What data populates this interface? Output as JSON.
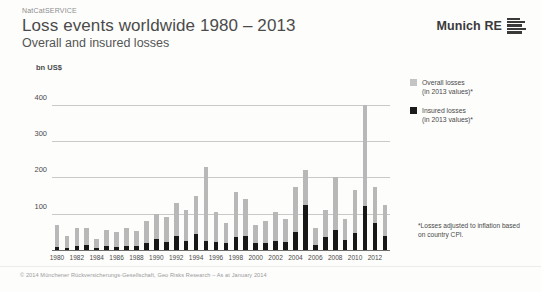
{
  "header": {
    "eyebrow": "NatCatSERVICE",
    "title": "Loss events worldwide 1980 – 2013",
    "subtitle": "Overall and insured losses",
    "brand": "Munich RE",
    "brand_mark": "munich-re-logo-bars"
  },
  "legend": {
    "overall_line1": "Overall losses",
    "overall_line2": "(in 2013 values)*",
    "insured_line1": "Insured losses",
    "insured_line2": "(in 2013 values)*"
  },
  "footnote": "*Losses adjusted to inflation based on country CPI.",
  "copyright": "© 2014 Münchener Rückversicherungs-Gesellschaft, Geo Risks Research – As at January 2014",
  "colors": {
    "overall": "#b8b8b8",
    "insured": "#171717",
    "grid": "#c9c9c9",
    "axis": "#6d6d6d",
    "text": "#4a4a4a"
  },
  "chart_data": {
    "type": "bar",
    "title": "Loss events worldwide 1980 – 2013",
    "subtitle": "Overall and insured losses",
    "xlabel": "",
    "ylabel": "bn US$",
    "ylim": [
      0,
      430
    ],
    "yticks": [
      100,
      200,
      300,
      400
    ],
    "ytick_labels": [
      "100",
      "200",
      "300",
      "400"
    ],
    "grid": true,
    "stacked": false,
    "legend_position": "right",
    "categories": [
      "1980",
      "1981",
      "1982",
      "1983",
      "1984",
      "1985",
      "1986",
      "1987",
      "1988",
      "1989",
      "1990",
      "1991",
      "1992",
      "1993",
      "1994",
      "1995",
      "1996",
      "1997",
      "1998",
      "1999",
      "2000",
      "2001",
      "2002",
      "2003",
      "2004",
      "2005",
      "2006",
      "2007",
      "2008",
      "2009",
      "2010",
      "2011",
      "2012",
      "2013"
    ],
    "tick_labels": [
      "1980",
      "",
      "1982",
      "",
      "1984",
      "",
      "1986",
      "",
      "1988",
      "",
      "1990",
      "",
      "1992",
      "",
      "1994",
      "",
      "1996",
      "",
      "1998",
      "",
      "2000",
      "",
      "2002",
      "",
      "2004",
      "",
      "2006",
      "",
      "2008",
      "",
      "2010",
      "",
      "2012",
      ""
    ],
    "series": [
      {
        "name": "Overall losses (in 2013 values)*",
        "color": "#b8b8b8",
        "values": [
          70,
          40,
          60,
          62,
          30,
          55,
          50,
          60,
          52,
          80,
          100,
          90,
          130,
          110,
          150,
          230,
          105,
          75,
          160,
          140,
          70,
          80,
          105,
          85,
          175,
          220,
          60,
          110,
          200,
          85,
          165,
          400,
          175,
          125
        ]
      },
      {
        "name": "Insured losses (in 2013 values)*",
        "color": "#171717",
        "values": [
          8,
          6,
          10,
          14,
          6,
          10,
          9,
          12,
          10,
          18,
          30,
          22,
          40,
          25,
          45,
          25,
          22,
          20,
          35,
          40,
          20,
          18,
          25,
          22,
          50,
          125,
          15,
          35,
          55,
          28,
          48,
          120,
          75,
          38
        ]
      }
    ]
  }
}
